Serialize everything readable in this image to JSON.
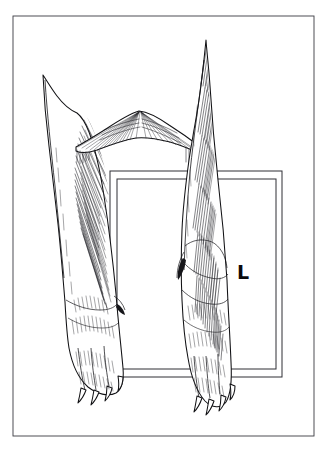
{
  "figure": {
    "style": "line-art-hatching",
    "background_color": "#ffffff",
    "ink_color": "#16161a"
  },
  "frame": {
    "name": "outer-border",
    "x": 13,
    "y": 16,
    "width": 301,
    "height": 420,
    "stroke_color": "#3b3b42",
    "stroke_width": 0.9
  },
  "plate": {
    "label": "radiographic-cassette",
    "outer": {
      "x": 110,
      "y": 171,
      "width": 172,
      "height": 206
    },
    "inner": {
      "x": 117,
      "y": 179,
      "width": 159,
      "height": 190
    },
    "stroke_color": "#2e2e34",
    "marker": {
      "text": "L",
      "meaning": "left-side-marker",
      "x": 243,
      "y": 272,
      "font_size": 19,
      "color": "#0a0a0c"
    }
  },
  "anatomy": {
    "left_limb": {
      "name": "left-forelimb",
      "top_y": 75,
      "paw_bottom_y": 404,
      "claw_count": 4,
      "has_dewclaw": true
    },
    "right_limb": {
      "name": "right-forelimb",
      "top_y": 40,
      "paw_bottom_y": 414,
      "claw_count": 4,
      "has_dewclaw": true
    },
    "brisket": {
      "name": "chest-brisket-drape",
      "top_y": 111,
      "bottom_y": 152,
      "left_x": 76,
      "right_x": 200
    }
  },
  "colors": {
    "paper": "#ffffff",
    "ink": "#16161a",
    "hatch": "#202024",
    "frame": "#3b3b42",
    "plate": "#2e2e34"
  }
}
